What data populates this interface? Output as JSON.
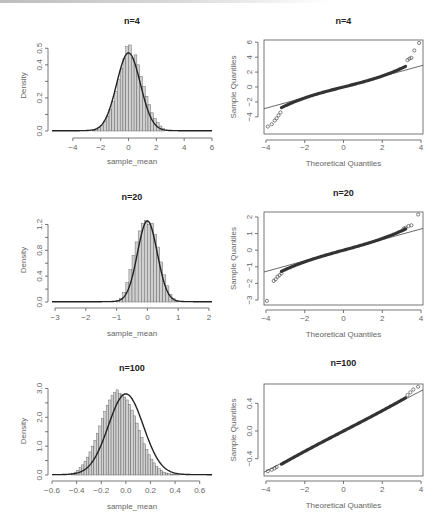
{
  "colors": {
    "axis": "#555555",
    "bars": "#cfcfcf",
    "bar_edge": "#555555",
    "curve": "#222222",
    "points": "#333333",
    "line": "#444444"
  },
  "caption": "",
  "chart_data": [
    {
      "id": "hist_n4",
      "type": "bar",
      "title": "n=4",
      "xlabel": "sample_mean",
      "ylabel": "Density",
      "xlim": [
        -5.5,
        6
      ],
      "ylim": [
        0,
        0.55
      ],
      "xticks": [
        -4,
        -2,
        0,
        2,
        4,
        6
      ],
      "xtick_labels": [
        "-4",
        "-2",
        "0",
        "2",
        "4",
        "6"
      ],
      "yticks": [
        0.0,
        0.1,
        0.2,
        0.3,
        0.4,
        0.5
      ],
      "ytick_labels": [
        "0.0",
        "",
        "0.2",
        "",
        "0.4",
        "0.5"
      ],
      "overlay": "density curve, peak ~0.47 at 0",
      "bins": {
        "start": -2.6,
        "width": 0.2,
        "values": [
          0.005,
          0.01,
          0.02,
          0.035,
          0.06,
          0.09,
          0.13,
          0.18,
          0.24,
          0.31,
          0.38,
          0.44,
          0.51,
          0.52,
          0.44,
          0.46,
          0.4,
          0.33,
          0.27,
          0.21,
          0.16,
          0.11,
          0.075,
          0.05,
          0.03,
          0.015
        ]
      },
      "curve_sd": 0.85,
      "curve_peak": 0.47
    },
    {
      "id": "qq_n4",
      "type": "scatter",
      "title": "n=4",
      "xlabel": "Theoretical Quantiles",
      "ylabel": "Sample Quantiles",
      "xlim": [
        -4.1,
        4.1
      ],
      "ylim": [
        -6.3,
        6.3
      ],
      "xticks": [
        -4,
        -2,
        0,
        2,
        4
      ],
      "xtick_labels": [
        "-4",
        "-2",
        "0",
        "2",
        "4"
      ],
      "yticks": [
        -4,
        -2,
        0,
        2,
        4,
        6
      ],
      "ytick_labels": [
        "-4",
        "-2",
        "0",
        "2",
        "4",
        "6"
      ],
      "ref_line": {
        "slope": 0.71,
        "intercept": 0.0
      },
      "tail_points": [
        [
          -3.9,
          -5.3
        ],
        [
          -3.7,
          -5.0
        ],
        [
          -3.55,
          -4.5
        ],
        [
          -3.45,
          -4.2
        ],
        [
          -3.35,
          -3.8
        ],
        [
          -3.25,
          -3.4
        ],
        [
          3.3,
          3.6
        ],
        [
          3.4,
          3.8
        ],
        [
          3.5,
          3.9
        ],
        [
          3.65,
          4.9
        ],
        [
          3.9,
          5.9
        ]
      ],
      "body_shape": "heavy-tailed S-curve"
    },
    {
      "id": "hist_n20",
      "type": "bar",
      "title": "n=20",
      "xlabel": "sample_mean",
      "ylabel": "Density",
      "xlim": [
        -3.1,
        2.1
      ],
      "ylim": [
        0,
        1.3
      ],
      "xticks": [
        -3,
        -2,
        -1,
        0,
        1,
        2
      ],
      "xtick_labels": [
        "-3",
        "-2",
        "-1",
        "0",
        "1",
        "2"
      ],
      "yticks": [
        0.0,
        0.2,
        0.4,
        0.6,
        0.8,
        1.0,
        1.2
      ],
      "ytick_labels": [
        "0.0",
        "",
        "0.4",
        "",
        "0.8",
        "",
        "1.2"
      ],
      "overlay": "density curve, peak ~1.25 at 0",
      "bins": {
        "start": -1.0,
        "width": 0.1,
        "values": [
          0.02,
          0.06,
          0.15,
          0.3,
          0.5,
          0.72,
          0.93,
          1.1,
          1.22,
          1.26,
          1.2,
          1.22,
          1.05,
          0.85,
          0.62,
          0.42,
          0.25,
          0.12,
          0.05,
          0.02
        ]
      },
      "curve_sd": 0.32,
      "curve_peak": 1.25
    },
    {
      "id": "qq_n20",
      "type": "scatter",
      "title": "n=20",
      "xlabel": "Theoretical Quantiles",
      "ylabel": "Sample Quantiles",
      "xlim": [
        -4.1,
        4.1
      ],
      "ylim": [
        -3.3,
        2.3
      ],
      "xticks": [
        -4,
        -2,
        0,
        2,
        4
      ],
      "xtick_labels": [
        "-4",
        "-2",
        "0",
        "2",
        "4"
      ],
      "yticks": [
        -3,
        -2,
        -1,
        0,
        1,
        2
      ],
      "ytick_labels": [
        "-3",
        "-2",
        "-1",
        "0",
        "1",
        "2"
      ],
      "ref_line": {
        "slope": 0.32,
        "intercept": 0.0
      },
      "tail_points": [
        [
          -3.95,
          -3.05
        ],
        [
          -3.6,
          -1.85
        ],
        [
          -3.5,
          -1.75
        ],
        [
          -3.4,
          -1.6
        ],
        [
          -3.3,
          -1.5
        ],
        [
          -3.2,
          -1.4
        ],
        [
          3.1,
          1.3
        ],
        [
          3.2,
          1.35
        ],
        [
          3.35,
          1.45
        ],
        [
          3.5,
          1.5
        ],
        [
          3.85,
          2.15
        ]
      ],
      "body_shape": "mildly heavy-tailed"
    },
    {
      "id": "hist_n100",
      "type": "bar",
      "title": "n=100",
      "xlabel": "sample_mean",
      "ylabel": "Density",
      "xlim": [
        -0.6,
        0.7
      ],
      "ylim": [
        0,
        3.05
      ],
      "xticks": [
        -0.6,
        -0.4,
        -0.2,
        0.0,
        0.2,
        0.4,
        0.6
      ],
      "xtick_labels": [
        "-0.6",
        "-0.4",
        "-0.2",
        "0.0",
        "0.2",
        "0.4",
        "0.6"
      ],
      "yticks": [
        0.0,
        0.5,
        1.0,
        1.5,
        2.0,
        2.5,
        3.0
      ],
      "ytick_labels": [
        "0.0",
        "",
        "1.0",
        "",
        "2.0",
        "",
        "3.0"
      ],
      "overlay": "density curve, peak ~2.8 at 0",
      "bins": {
        "start": -0.44,
        "width": 0.02,
        "values": [
          0.05,
          0.1,
          0.16,
          0.25,
          0.35,
          0.48,
          0.62,
          0.8,
          1.0,
          1.2,
          1.45,
          1.7,
          1.95,
          2.2,
          2.42,
          2.6,
          2.75,
          2.85,
          2.95,
          2.82,
          2.78,
          2.7,
          2.6,
          2.45,
          2.25,
          2.05,
          1.8,
          1.55,
          1.3,
          1.08,
          0.88,
          0.7,
          0.55,
          0.42,
          0.3,
          0.22,
          0.15,
          0.1,
          0.07,
          0.05,
          0.03,
          0.02,
          0.01,
          0.005
        ]
      },
      "curve_sd": 0.142,
      "curve_peak": 2.8
    },
    {
      "id": "qq_n100",
      "type": "scatter",
      "title": "n=100",
      "xlabel": "Theoretical Quantiles",
      "ylabel": "Sample Quantiles",
      "xlim": [
        -4.1,
        4.1
      ],
      "ylim": [
        -0.65,
        0.68
      ],
      "xticks": [
        -4,
        -2,
        0,
        2,
        4
      ],
      "xtick_labels": [
        "-4",
        "-2",
        "0",
        "2",
        "4"
      ],
      "yticks": [
        -0.4,
        0.0,
        0.4
      ],
      "ytick_labels": [
        "-0.4",
        "0.0",
        "0.4"
      ],
      "ref_line": {
        "slope": 0.145,
        "intercept": 0.0
      },
      "tail_points": [
        [
          -3.9,
          -0.58
        ],
        [
          -3.7,
          -0.56
        ],
        [
          -3.55,
          -0.54
        ],
        [
          -3.45,
          -0.52
        ],
        [
          3.3,
          0.52
        ],
        [
          3.45,
          0.56
        ],
        [
          3.6,
          0.6
        ],
        [
          3.85,
          0.64
        ]
      ],
      "body_shape": "near-linear"
    }
  ]
}
